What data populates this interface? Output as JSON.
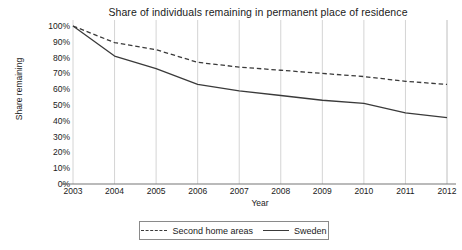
{
  "chart_data": {
    "type": "line",
    "title": "Share of individuals remaining in permanent place of residence",
    "xlabel": "Year",
    "ylabel": "Share remaining",
    "categories": [
      2003,
      2004,
      2005,
      2006,
      2007,
      2008,
      2009,
      2010,
      2011,
      2012
    ],
    "x": [
      2003,
      2004,
      2005,
      2006,
      2007,
      2008,
      2009,
      2010,
      2011,
      2012
    ],
    "xtick_labels": [
      "2003",
      "2004",
      "2005",
      "2006",
      "2007",
      "2008",
      "2009",
      "2010",
      "2011",
      "2012"
    ],
    "ytick_labels": [
      "100%",
      "90%",
      "80%",
      "70%",
      "60%",
      "50%",
      "40%",
      "30%",
      "20%",
      "10%",
      "0%"
    ],
    "ytick_values": [
      100,
      90,
      80,
      70,
      60,
      50,
      40,
      30,
      20,
      10,
      0
    ],
    "ylim": [
      0,
      100
    ],
    "xlim": [
      2003,
      2012
    ],
    "grid": "vertical",
    "legend_position": "bottom",
    "series": [
      {
        "name": "Second home areas",
        "style": "dashed",
        "color": "#3a3a3a",
        "values": [
          100,
          89.5,
          85,
          77,
          74,
          72,
          70,
          68,
          65,
          63
        ]
      },
      {
        "name": "Sweden",
        "style": "solid",
        "color": "#3a3a3a",
        "values": [
          100,
          81,
          73,
          63,
          59,
          56,
          53,
          51,
          45,
          42
        ]
      }
    ]
  },
  "legend": {
    "items": [
      {
        "label": "Second home areas",
        "style": "dashed"
      },
      {
        "label": "Sweden",
        "style": "solid"
      }
    ]
  }
}
